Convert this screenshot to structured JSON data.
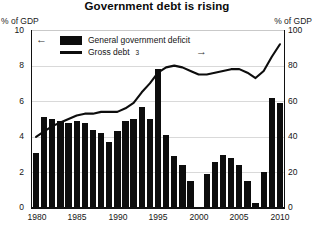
{
  "title": "Government debt is rising",
  "axis": {
    "left_unit": "% of GDP",
    "right_unit": "% of GDP",
    "left_ticks": [
      "10",
      "8",
      "6",
      "4",
      "2",
      "0"
    ],
    "right_ticks": [
      "100",
      "80",
      "60",
      "40",
      "20",
      "0"
    ],
    "x_ticks": [
      "1980",
      "1985",
      "1990",
      "1995",
      "2000",
      "2005",
      "2010"
    ]
  },
  "legend": {
    "bar_label": "General government deficit",
    "line_label": "Gross debt",
    "line_footnote": "3",
    "left_arrow": "←",
    "right_arrow": "→"
  },
  "colors": {
    "bar": "#0d0d0d",
    "line": "#0d0d0d",
    "grid": "#d9d9d9",
    "axis": "#111111",
    "background": "#ffffff"
  },
  "chart_data": {
    "type": "bar",
    "title": "Government debt is rising",
    "xlabel": "",
    "ylabel": "% of GDP",
    "ylim": [
      0,
      10
    ],
    "y2lim": [
      0,
      100
    ],
    "grid": true,
    "legend_position": "top-left",
    "x": [
      1980,
      1981,
      1982,
      1983,
      1984,
      1985,
      1986,
      1987,
      1988,
      1989,
      1990,
      1991,
      1992,
      1993,
      1994,
      1995,
      1996,
      1997,
      1998,
      1999,
      2000,
      2001,
      2002,
      2003,
      2004,
      2005,
      2006,
      2007,
      2008,
      2009,
      2010
    ],
    "series": [
      {
        "name": "General government deficit",
        "type": "bar",
        "axis": "left",
        "unit": "% of GDP",
        "values": [
          3.1,
          5.1,
          5.0,
          4.9,
          4.8,
          4.9,
          4.8,
          4.4,
          4.2,
          3.7,
          4.3,
          4.9,
          5.0,
          5.7,
          5.0,
          7.8,
          4.1,
          2.9,
          2.4,
          1.5,
          0.0,
          1.9,
          2.6,
          3.0,
          2.8,
          2.4,
          1.5,
          0.3,
          2.0,
          6.2,
          5.9
        ]
      },
      {
        "name": "Gross debt",
        "type": "line",
        "axis": "right",
        "unit": "% of GDP",
        "values": [
          40,
          43,
          46,
          48,
          50,
          52,
          53,
          53,
          54,
          54,
          54,
          56,
          59,
          65,
          70,
          76,
          79,
          80,
          79,
          77,
          75,
          75,
          76,
          77,
          78,
          78,
          76,
          73,
          77,
          85,
          92
        ]
      }
    ]
  }
}
